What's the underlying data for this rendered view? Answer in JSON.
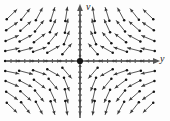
{
  "figure": {
    "background_color": "#fdfdfd"
  },
  "axes": {
    "vertical": {
      "label": "v",
      "name": "v-axis",
      "x_px": 80,
      "arrow": "up",
      "color": "#555555"
    },
    "horizontal": {
      "label": "y",
      "name": "y-axis",
      "y_px": 61,
      "arrow": "right",
      "color": "#555555"
    },
    "origin": {
      "x_px": 80,
      "y_px": 61,
      "marker": "filled-dot",
      "color": "#141414"
    }
  },
  "chart_data": {
    "type": "scatter",
    "xlabel": "y",
    "ylabel": "v",
    "grid": false,
    "legend": null,
    "xlim": [
      -5.5,
      5.5
    ],
    "ylim": [
      -4.0,
      4.0
    ],
    "critical_point": {
      "x": 0,
      "y": 0,
      "classification": "saddle"
    },
    "field_description": "Arrows drawn tail-dot to head-arrow; horizontal component points toward the v-axis, vertical component points away from the y-axis, producing a saddle at the origin.",
    "arrow_style": {
      "tail": "dot",
      "head": "arrow",
      "stroke_color": "#3a3a3a",
      "dot_color": "#141414",
      "length_px": 14
    },
    "grid_x": [
      -5,
      -4,
      -3,
      -2,
      -1,
      0,
      1,
      2,
      3,
      4,
      5
    ],
    "grid_y": [
      3.5,
      2.6,
      1.7,
      0.85,
      0,
      -0.85,
      -1.7,
      -2.6,
      -3.5
    ],
    "vector_rule": {
      "u": "-y",
      "v": "v"
    },
    "arrows": [
      {
        "x": -5,
        "y": 3.5,
        "dx": 0.72,
        "dy": 0.69
      },
      {
        "x": -4,
        "y": 3.5,
        "dx": 0.62,
        "dy": 0.78
      },
      {
        "x": -3,
        "y": 3.5,
        "dx": 0.47,
        "dy": 0.88
      },
      {
        "x": -2,
        "y": 3.5,
        "dx": 0.3,
        "dy": 0.95
      },
      {
        "x": -1,
        "y": 3.5,
        "dx": 0.15,
        "dy": 0.99
      },
      {
        "x": 0,
        "y": 3.5,
        "dx": 0.0,
        "dy": 1.0
      },
      {
        "x": 1,
        "y": 3.5,
        "dx": -0.15,
        "dy": 0.99
      },
      {
        "x": 2,
        "y": 3.5,
        "dx": -0.3,
        "dy": 0.95
      },
      {
        "x": 3,
        "y": 3.5,
        "dx": -0.47,
        "dy": 0.88
      },
      {
        "x": 4,
        "y": 3.5,
        "dx": -0.62,
        "dy": 0.78
      },
      {
        "x": 5,
        "y": 3.5,
        "dx": -0.72,
        "dy": 0.69
      },
      {
        "x": -5,
        "y": 2.6,
        "dx": 0.82,
        "dy": 0.57
      },
      {
        "x": -4,
        "y": 2.6,
        "dx": 0.75,
        "dy": 0.66
      },
      {
        "x": -3,
        "y": 2.6,
        "dx": 0.62,
        "dy": 0.78
      },
      {
        "x": -2,
        "y": 2.6,
        "dx": 0.42,
        "dy": 0.91
      },
      {
        "x": -1,
        "y": 2.6,
        "dx": 0.22,
        "dy": 0.97
      },
      {
        "x": 0,
        "y": 2.6,
        "dx": 0.0,
        "dy": 1.0
      },
      {
        "x": 1,
        "y": 2.6,
        "dx": -0.22,
        "dy": 0.97
      },
      {
        "x": 2,
        "y": 2.6,
        "dx": -0.42,
        "dy": 0.91
      },
      {
        "x": 3,
        "y": 2.6,
        "dx": -0.62,
        "dy": 0.78
      },
      {
        "x": 4,
        "y": 2.6,
        "dx": -0.75,
        "dy": 0.66
      },
      {
        "x": 5,
        "y": 2.6,
        "dx": -0.82,
        "dy": 0.57
      },
      {
        "x": -5,
        "y": 1.7,
        "dx": 0.92,
        "dy": 0.39
      },
      {
        "x": -4,
        "y": 1.7,
        "dx": 0.88,
        "dy": 0.47
      },
      {
        "x": -3,
        "y": 1.7,
        "dx": 0.8,
        "dy": 0.6
      },
      {
        "x": -2,
        "y": 1.7,
        "dx": 0.64,
        "dy": 0.77
      },
      {
        "x": -1,
        "y": 1.7,
        "dx": 0.38,
        "dy": 0.93
      },
      {
        "x": 0,
        "y": 1.7,
        "dx": 0.0,
        "dy": 1.0
      },
      {
        "x": 1,
        "y": 1.7,
        "dx": -0.38,
        "dy": 0.93
      },
      {
        "x": 2,
        "y": 1.7,
        "dx": -0.64,
        "dy": 0.77
      },
      {
        "x": 3,
        "y": 1.7,
        "dx": -0.8,
        "dy": 0.6
      },
      {
        "x": 4,
        "y": 1.7,
        "dx": -0.88,
        "dy": 0.47
      },
      {
        "x": 5,
        "y": 1.7,
        "dx": -0.92,
        "dy": 0.39
      },
      {
        "x": -5,
        "y": 0.85,
        "dx": 0.98,
        "dy": 0.2
      },
      {
        "x": -4,
        "y": 0.85,
        "dx": 0.97,
        "dy": 0.25
      },
      {
        "x": -3,
        "y": 0.85,
        "dx": 0.94,
        "dy": 0.33
      },
      {
        "x": -2,
        "y": 0.85,
        "dx": 0.87,
        "dy": 0.49
      },
      {
        "x": -1,
        "y": 0.85,
        "dx": 0.65,
        "dy": 0.76
      },
      {
        "x": 0,
        "y": 0.85,
        "dx": 0.0,
        "dy": 1.0
      },
      {
        "x": 1,
        "y": 0.85,
        "dx": -0.65,
        "dy": 0.76
      },
      {
        "x": 2,
        "y": 0.85,
        "dx": -0.87,
        "dy": 0.49
      },
      {
        "x": 3,
        "y": 0.85,
        "dx": -0.94,
        "dy": 0.33
      },
      {
        "x": 4,
        "y": 0.85,
        "dx": -0.97,
        "dy": 0.25
      },
      {
        "x": 5,
        "y": 0.85,
        "dx": -0.98,
        "dy": 0.2
      },
      {
        "x": -5,
        "y": 0,
        "dx": 1.0,
        "dy": 0.0
      },
      {
        "x": -4,
        "y": 0,
        "dx": 1.0,
        "dy": 0.0
      },
      {
        "x": -3,
        "y": 0,
        "dx": 1.0,
        "dy": 0.0
      },
      {
        "x": -2,
        "y": 0,
        "dx": 1.0,
        "dy": 0.0
      },
      {
        "x": -1,
        "y": 0,
        "dx": 1.0,
        "dy": 0.0
      },
      {
        "x": 1,
        "y": 0,
        "dx": -1.0,
        "dy": 0.0
      },
      {
        "x": 2,
        "y": 0,
        "dx": -1.0,
        "dy": 0.0
      },
      {
        "x": 3,
        "y": 0,
        "dx": -1.0,
        "dy": 0.0
      },
      {
        "x": 4,
        "y": 0,
        "dx": -1.0,
        "dy": 0.0
      },
      {
        "x": 5,
        "y": 0,
        "dx": -1.0,
        "dy": 0.0
      },
      {
        "x": -5,
        "y": -0.85,
        "dx": 0.98,
        "dy": -0.2
      },
      {
        "x": -4,
        "y": -0.85,
        "dx": 0.97,
        "dy": -0.25
      },
      {
        "x": -3,
        "y": -0.85,
        "dx": 0.94,
        "dy": -0.33
      },
      {
        "x": -2,
        "y": -0.85,
        "dx": 0.87,
        "dy": -0.49
      },
      {
        "x": -1,
        "y": -0.85,
        "dx": 0.65,
        "dy": -0.76
      },
      {
        "x": 0,
        "y": -0.85,
        "dx": 0.0,
        "dy": -1.0
      },
      {
        "x": 1,
        "y": -0.85,
        "dx": -0.65,
        "dy": -0.76
      },
      {
        "x": 2,
        "y": -0.85,
        "dx": -0.87,
        "dy": -0.49
      },
      {
        "x": 3,
        "y": -0.85,
        "dx": -0.94,
        "dy": -0.33
      },
      {
        "x": 4,
        "y": -0.85,
        "dx": -0.97,
        "dy": -0.25
      },
      {
        "x": 5,
        "y": -0.85,
        "dx": -0.98,
        "dy": -0.2
      },
      {
        "x": -5,
        "y": -1.7,
        "dx": 0.92,
        "dy": -0.39
      },
      {
        "x": -4,
        "y": -1.7,
        "dx": 0.88,
        "dy": -0.47
      },
      {
        "x": -3,
        "y": -1.7,
        "dx": 0.8,
        "dy": -0.6
      },
      {
        "x": -2,
        "y": -1.7,
        "dx": 0.64,
        "dy": -0.77
      },
      {
        "x": -1,
        "y": -1.7,
        "dx": 0.38,
        "dy": -0.93
      },
      {
        "x": 0,
        "y": -1.7,
        "dx": 0.0,
        "dy": -1.0
      },
      {
        "x": 1,
        "y": -1.7,
        "dx": -0.38,
        "dy": -0.93
      },
      {
        "x": 2,
        "y": -1.7,
        "dx": -0.64,
        "dy": -0.77
      },
      {
        "x": 3,
        "y": -1.7,
        "dx": -0.8,
        "dy": -0.6
      },
      {
        "x": 4,
        "y": -1.7,
        "dx": -0.88,
        "dy": -0.47
      },
      {
        "x": 5,
        "y": -1.7,
        "dx": -0.92,
        "dy": -0.39
      },
      {
        "x": -5,
        "y": -2.6,
        "dx": 0.82,
        "dy": -0.57
      },
      {
        "x": -4,
        "y": -2.6,
        "dx": 0.75,
        "dy": -0.66
      },
      {
        "x": -3,
        "y": -2.6,
        "dx": 0.62,
        "dy": -0.78
      },
      {
        "x": -2,
        "y": -2.6,
        "dx": 0.42,
        "dy": -0.91
      },
      {
        "x": -1,
        "y": -2.6,
        "dx": 0.22,
        "dy": -0.97
      },
      {
        "x": 0,
        "y": -2.6,
        "dx": 0.0,
        "dy": -1.0
      },
      {
        "x": 1,
        "y": -2.6,
        "dx": -0.22,
        "dy": -0.97
      },
      {
        "x": 2,
        "y": -2.6,
        "dx": -0.42,
        "dy": -0.91
      },
      {
        "x": 3,
        "y": -2.6,
        "dx": -0.62,
        "dy": -0.78
      },
      {
        "x": 4,
        "y": -2.6,
        "dx": -0.75,
        "dy": -0.66
      },
      {
        "x": 5,
        "y": -2.6,
        "dx": -0.82,
        "dy": -0.57
      },
      {
        "x": -5,
        "y": -3.5,
        "dx": 0.72,
        "dy": -0.69
      },
      {
        "x": -4,
        "y": -3.5,
        "dx": 0.62,
        "dy": -0.78
      },
      {
        "x": -3,
        "y": -3.5,
        "dx": 0.47,
        "dy": -0.88
      },
      {
        "x": -2,
        "y": -3.5,
        "dx": 0.3,
        "dy": -0.95
      },
      {
        "x": -1,
        "y": -3.5,
        "dx": 0.15,
        "dy": -0.99
      },
      {
        "x": 0,
        "y": -3.5,
        "dx": 0.0,
        "dy": -1.0
      },
      {
        "x": 1,
        "y": -3.5,
        "dx": -0.15,
        "dy": -0.99
      },
      {
        "x": 2,
        "y": -3.5,
        "dx": -0.3,
        "dy": -0.95
      },
      {
        "x": 3,
        "y": -3.5,
        "dx": -0.47,
        "dy": -0.88
      },
      {
        "x": 4,
        "y": -3.5,
        "dx": -0.62,
        "dy": -0.78
      },
      {
        "x": 5,
        "y": -3.5,
        "dx": -0.72,
        "dy": -0.69
      }
    ],
    "axis_ticks": {
      "x_positions": [
        -5,
        -4,
        -3,
        -2,
        -1,
        1,
        2,
        3,
        4,
        5
      ],
      "y_positions": [
        3.5,
        2.6,
        1.7,
        0.85,
        -0.85,
        -1.7,
        -2.6,
        -3.5
      ],
      "length_px": 4,
      "labeled": false
    }
  }
}
